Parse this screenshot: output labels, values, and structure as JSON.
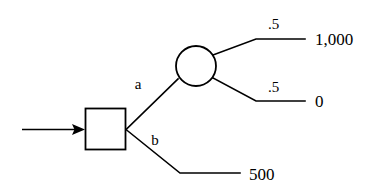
{
  "diagram": {
    "type": "decision-tree",
    "title": "",
    "background_color": "#ffffff",
    "line_color": "#000000",
    "nodes": {
      "decision": {
        "shape": "square",
        "label": "",
        "role": "decision-node"
      },
      "chance": {
        "shape": "circle",
        "label": "",
        "role": "chance-node"
      }
    },
    "entry": {
      "arrow_label": ""
    },
    "branches": {
      "alternative_a": {
        "label": "a",
        "leads_to": "chance-node"
      },
      "alternative_b": {
        "label": "b",
        "leads_to": "payoff-500"
      }
    },
    "probabilities": {
      "upper": ".5",
      "lower": ".5"
    },
    "payoffs": {
      "upper": "1,000",
      "lower": "0",
      "alternative_b": "500"
    }
  }
}
